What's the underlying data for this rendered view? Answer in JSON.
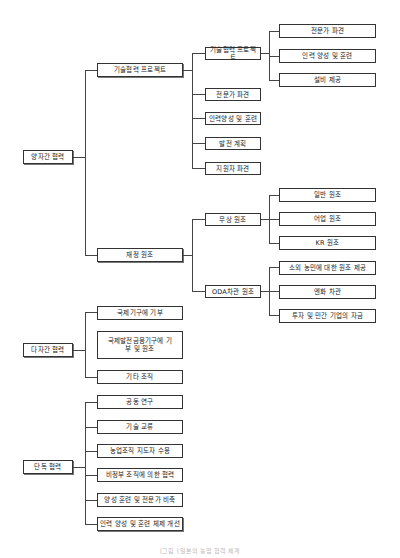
{
  "diagram": {
    "type": "tree",
    "roots": [
      {
        "label": "양자간 협력",
        "children": [
          {
            "label": "기술협력 프로젝트",
            "children": [
              {
                "label": "기술협력 프로젝트",
                "children": [
                  {
                    "label": "전문가 파견"
                  },
                  {
                    "label": "인력 양성 및 훈련"
                  },
                  {
                    "label": "설비 제공"
                  }
                ]
              },
              {
                "label": "전문가 파견"
              },
              {
                "label": "인력양성 및 훈련"
              },
              {
                "label": "발전 계획"
              },
              {
                "label": "지원자 파견"
              }
            ]
          },
          {
            "label": "재정 원조",
            "children": [
              {
                "label": "무상 원조",
                "children": [
                  {
                    "label": "일반 원조"
                  },
                  {
                    "label": "어업 원조"
                  },
                  {
                    "label": "KR 원조"
                  }
                ]
              },
              {
                "label": "ODA차관 원조",
                "children": [
                  {
                    "label": "소외 농민에 대한 원조 제공"
                  },
                  {
                    "label": "엔화 차관"
                  },
                  {
                    "label": "투자 및 민간 기업의 자금"
                  }
                ]
              }
            ]
          }
        ]
      },
      {
        "label": "다자간 협력",
        "children": [
          {
            "label": "국제기구에 기부"
          },
          {
            "label": "국제발전금융기구에 기부 및 원조"
          },
          {
            "label": "기타 조직"
          }
        ]
      },
      {
        "label": "단독 협력",
        "children": [
          {
            "label": "공동 연구"
          },
          {
            "label": "기술 교류"
          },
          {
            "label": "농업조직 지도자 수용"
          },
          {
            "label": "비정부 조직에 의한 협력"
          },
          {
            "label": "양성 훈련 및 전문가 비축"
          },
          {
            "label": "인력 양성 및 훈련 체제 개선"
          }
        ]
      }
    ]
  },
  "caption": "[그림 ] 일본의 농업 협력 체계"
}
